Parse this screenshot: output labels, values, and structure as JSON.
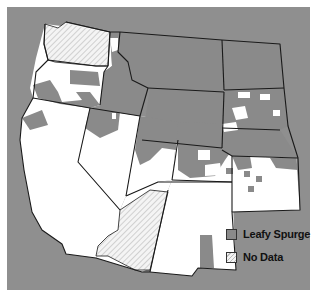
{
  "map": {
    "title": "",
    "region": "Western United States",
    "colors": {
      "background": "#8f8f8f",
      "leafy_spurge": "#8a8a8a",
      "absent": "#ffffff",
      "no_data_hatch": "#f4f4f4",
      "border": "#1a1a1a"
    },
    "states": [
      "WA",
      "OR",
      "CA",
      "ID",
      "NV",
      "MT",
      "WY",
      "UT",
      "AZ",
      "CO",
      "NM",
      "ND",
      "SD",
      "NE",
      "KS"
    ],
    "no_data_states": [
      "WA",
      "AZ"
    ]
  },
  "legend": {
    "items": [
      {
        "label": "Leafy Spurge",
        "swatch": "spurge"
      },
      {
        "label": "No Data",
        "swatch": "nodata"
      }
    ]
  }
}
